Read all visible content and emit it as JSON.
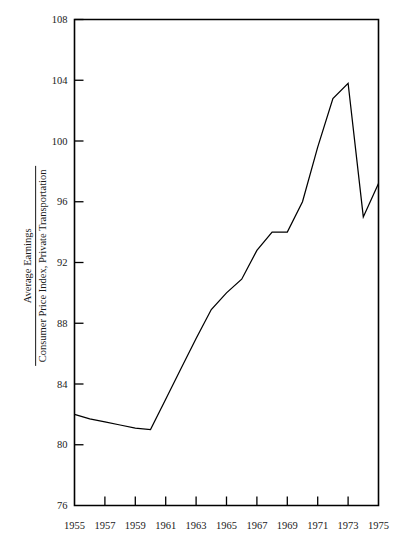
{
  "chart_data": {
    "type": "line",
    "title": "",
    "subtitle": "",
    "xlabel": "",
    "ylabel_numerator": "Average Earnings",
    "ylabel_denominator": "Consumer Price Index, Private Transportation",
    "grid": false,
    "legend": "none",
    "xlim": [
      1955,
      1975
    ],
    "ylim": [
      76,
      108
    ],
    "xticks": [
      1955,
      1957,
      1959,
      1961,
      1963,
      1965,
      1967,
      1969,
      1971,
      1973,
      1975
    ],
    "xtick_labels": [
      "1955",
      "1957",
      "1959",
      "1961",
      "1963",
      "1965",
      "1967",
      "1969",
      "1971",
      "1973",
      "1975"
    ],
    "yticks": [
      76,
      80,
      84,
      88,
      92,
      96,
      100,
      104,
      108
    ],
    "ytick_labels": [
      "76",
      "80",
      "84",
      "88",
      "92",
      "96",
      "100",
      "104",
      "108"
    ],
    "series": [
      {
        "name": "Average Earnings / CPI Private Transportation",
        "color": "#000000",
        "x": [
          1955,
          1956,
          1957,
          1958,
          1959,
          1960,
          1961,
          1962,
          1963,
          1964,
          1965,
          1966,
          1967,
          1968,
          1969,
          1970,
          1971,
          1972,
          1973,
          1974,
          1975
        ],
        "y": [
          82.0,
          81.7,
          81.5,
          81.3,
          81.1,
          81.0,
          83.0,
          85.0,
          87.0,
          88.9,
          90.0,
          90.9,
          92.8,
          94.0,
          94.0,
          96.0,
          99.6,
          102.8,
          103.8,
          95.0,
          97.2
        ]
      }
    ]
  },
  "axes": {
    "y_axis_label_parts": {
      "numerator": "Average Earnings",
      "denominator": "Consumer Price Index, Private Transportation"
    }
  }
}
